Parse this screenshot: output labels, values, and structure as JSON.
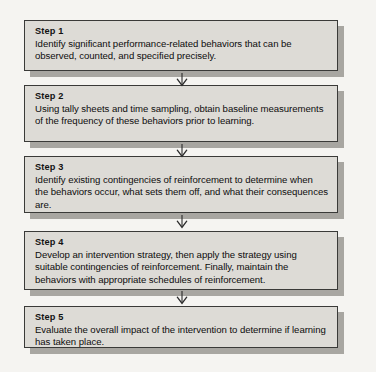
{
  "diagram": {
    "type": "flowchart",
    "orientation": "vertical",
    "colors": {
      "page_background": "#f5f4f1",
      "box_fill": "#dddbd6",
      "box_border": "#3a3a38",
      "box_shadow": "#a8a6a1",
      "text": "#0d0d0d",
      "arrow": "#2b2b2b"
    },
    "connector_icon": "down-arrow-icon",
    "steps": [
      {
        "title": "Step 1",
        "body": "Identify significant performance-related behaviors that can be observed, counted, and specified precisely."
      },
      {
        "title": "Step 2",
        "body": "Using tally sheets and time sampling, obtain baseline measurements of the frequency of these behaviors prior to learning."
      },
      {
        "title": "Step 3",
        "body": "Identify existing contingencies of reinforcement to determine when the behaviors occur, what sets them off, and what their consequences are."
      },
      {
        "title": "Step 4",
        "body": "Develop an intervention strategy, then apply the strategy using suitable contingencies of reinforcement. Finally, maintain the behaviors with appropriate schedules of reinforcement."
      },
      {
        "title": "Step 5",
        "body": "Evaluate the overall impact of the intervention to determine if learning has taken place."
      }
    ],
    "layout": {
      "box_tops": [
        20,
        85,
        156,
        231,
        306
      ],
      "box_heights": [
        51,
        57,
        57,
        59,
        42
      ],
      "arrow_tops": [
        73,
        144,
        215,
        291
      ]
    }
  }
}
